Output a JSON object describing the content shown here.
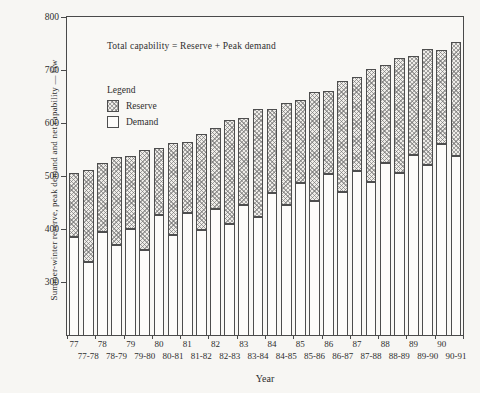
{
  "figure": {
    "annotation": "Total capability = Reserve + Peak demand",
    "y_axis_title": "Summer-winter reserve, peak demand and net capability — Gw",
    "x_axis_title": "Year",
    "legend": {
      "title": "Legend",
      "items": [
        {
          "label": "Reserve",
          "swatch": "hatched"
        },
        {
          "label": "Demand",
          "swatch": "white"
        }
      ]
    }
  },
  "chart_data": {
    "type": "bar",
    "stacked": true,
    "title": "",
    "annotation": "Total capability = Reserve + Peak demand",
    "xlabel": "Year",
    "ylabel": "Summer-winter reserve, peak demand and net capability — Gw",
    "unit": "Gw",
    "ylim": [
      200,
      800
    ],
    "yticks": [
      300,
      400,
      500,
      600,
      700,
      800
    ],
    "grid": false,
    "legend_position": "upper-left-inside",
    "note": "Pairs of bars per year: summer (e.g. 77) and winter (e.g. 77-78). Total capability = Demand + Reserve.",
    "categories": [
      "77",
      "77-78",
      "78",
      "78-79",
      "79",
      "79-80",
      "80",
      "80-81",
      "81",
      "81-82",
      "82",
      "82-83",
      "83",
      "83-84",
      "84",
      "84-85",
      "85",
      "85-86",
      "86",
      "86-87",
      "87",
      "87-88",
      "88",
      "88-89",
      "89",
      "89-90",
      "90",
      "90-91"
    ],
    "series": [
      {
        "name": "Demand",
        "values": [
          385,
          337,
          395,
          370,
          400,
          360,
          427,
          388,
          430,
          398,
          437,
          410,
          445,
          423,
          467,
          445,
          486,
          452,
          503,
          470,
          510,
          489,
          525,
          505,
          540,
          520,
          560,
          537
        ]
      },
      {
        "name": "Reserve",
        "values": [
          120,
          175,
          129,
          165,
          138,
          190,
          125,
          175,
          135,
          182,
          154,
          196,
          165,
          203,
          160,
          193,
          157,
          206,
          158,
          210,
          176,
          212,
          184,
          218,
          187,
          220,
          178,
          215
        ]
      }
    ],
    "totals": [
      505,
      512,
      524,
      535,
      538,
      550,
      552,
      563,
      565,
      580,
      591,
      606,
      610,
      626,
      627,
      638,
      643,
      658,
      661,
      680,
      686,
      701,
      709,
      723,
      727,
      740,
      738,
      752
    ]
  }
}
